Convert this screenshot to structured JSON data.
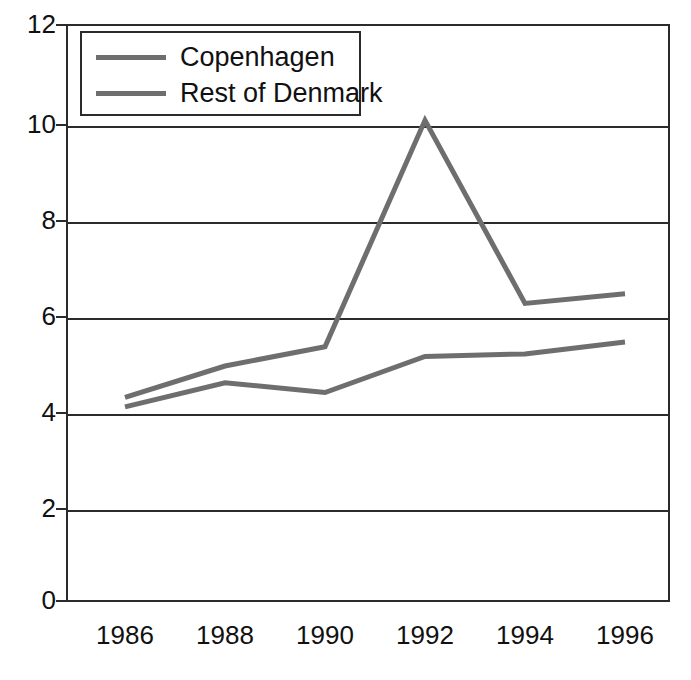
{
  "chart_data": {
    "type": "line",
    "title": "",
    "subtitle": "",
    "xlabel": "",
    "ylabel": "",
    "categories": [
      "1986",
      "1988",
      "1990",
      "1992",
      "1994",
      "1996"
    ],
    "series": [
      {
        "name": "Copenhagen",
        "color": "#6e6e6e",
        "values": [
          4.25,
          4.9,
          5.3,
          10.0,
          6.2,
          6.4
        ]
      },
      {
        "name": "Rest of Denmark",
        "color": "#6e6e6e",
        "values": [
          4.05,
          4.55,
          4.35,
          5.1,
          5.15,
          5.4
        ]
      }
    ],
    "ylim": [
      0,
      12
    ],
    "yticks": [
      0,
      2,
      4,
      6,
      8,
      10,
      12
    ],
    "ytick_labels": [
      "0",
      "2",
      "4",
      "6",
      "8",
      "10",
      "12"
    ],
    "grid": true,
    "grid_axis": "y",
    "legend_position": "upper left",
    "axis_color": "#2b2b2b",
    "background": "#ffffff"
  },
  "legend": {
    "entries": [
      {
        "label": "Copenhagen",
        "swatch_color": "#6e6e6e"
      },
      {
        "label": "Rest of Denmark",
        "swatch_color": "#6e6e6e"
      }
    ]
  }
}
